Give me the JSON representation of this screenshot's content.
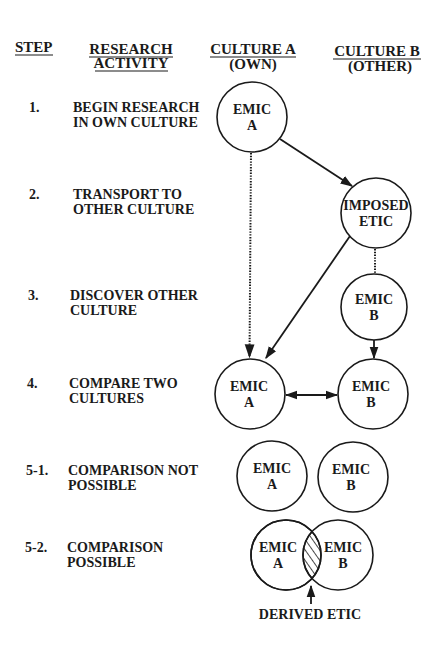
{
  "headers": {
    "step": "STEP",
    "activity_line1": "RESEARCH",
    "activity_line2": "ACTIVITY",
    "culture_a_line1": "CULTURE A",
    "culture_a_line2": "(OWN)",
    "culture_b_line1": "CULTURE B",
    "culture_b_line2": "(OTHER)"
  },
  "steps": [
    {
      "num": "1.",
      "line1": "BEGIN RESEARCH",
      "line2": "IN OWN CULTURE"
    },
    {
      "num": "2.",
      "line1": "TRANSPORT TO",
      "line2": "OTHER CULTURE"
    },
    {
      "num": "3.",
      "line1": "DISCOVER OTHER",
      "line2": "CULTURE"
    },
    {
      "num": "4.",
      "line1": "COMPARE TWO",
      "line2": "CULTURES"
    },
    {
      "num": "5-1.",
      "line1": "COMPARISON NOT",
      "line2": "POSSIBLE"
    },
    {
      "num": "5-2.",
      "line1": "COMPARISON",
      "line2": "POSSIBLE"
    }
  ],
  "nodes": {
    "step1_emic_a": {
      "line1": "EMIC",
      "line2": "A"
    },
    "step2_imposed_etic": {
      "line1": "IMPOSED",
      "line2": "ETIC"
    },
    "step3_emic_b": {
      "line1": "EMIC",
      "line2": "B"
    },
    "step4_emic_a": {
      "line1": "EMIC",
      "line2": "A"
    },
    "step4_emic_b": {
      "line1": "EMIC",
      "line2": "B"
    },
    "step51_emic_a": {
      "line1": "EMIC",
      "line2": "A"
    },
    "step51_emic_b": {
      "line1": "EMIC",
      "line2": "B"
    },
    "step52_emic_a": {
      "line1": "EMIC",
      "line2": "A"
    },
    "step52_emic_b": {
      "line1": "EMIC",
      "line2": "B"
    }
  },
  "derived_etic_label": "DERIVED ETIC",
  "colors": {
    "ink": "#1a1a1a",
    "background": "#ffffff"
  }
}
